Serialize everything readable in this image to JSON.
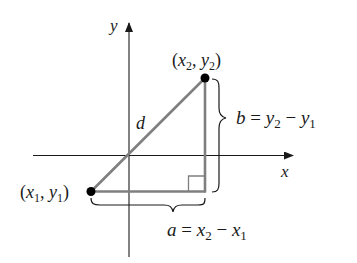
{
  "diagram": {
    "colors": {
      "axis": "#1a1a1a",
      "triangle": "#7f7f7f",
      "point": "#000000",
      "brace": "#1a1a1a",
      "text": "#1a1a1a"
    },
    "axes": {
      "x_label": "x",
      "y_label": "y"
    },
    "points": {
      "p1": {
        "open": "(",
        "x": "x",
        "x_sub": "1",
        "sep": ", ",
        "y": "y",
        "y_sub": "1",
        "close": ")"
      },
      "p2": {
        "open": "(",
        "x": "x",
        "x_sub": "2",
        "sep": ", ",
        "y": "y",
        "y_sub": "2",
        "close": ")"
      }
    },
    "hypotenuse_label": "d",
    "horizontal_leg": {
      "var": "a",
      "eq": " = ",
      "t1": "x",
      "t1_sub": "2",
      "minus": " − ",
      "t2": "x",
      "t2_sub": "1"
    },
    "vertical_leg": {
      "var": "b",
      "eq": " = ",
      "t1": "y",
      "t1_sub": "2",
      "minus": " − ",
      "t2": "y",
      "t2_sub": "1"
    }
  }
}
